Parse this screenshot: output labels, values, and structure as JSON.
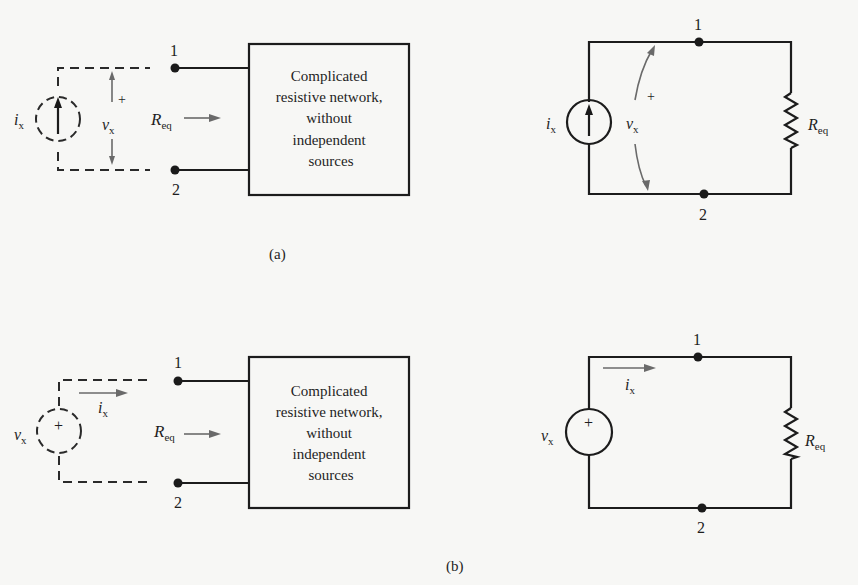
{
  "figure": {
    "panels": [
      {
        "id": "a",
        "caption": "(a)",
        "test_circuit": {
          "source_type": "current",
          "source_label": "i",
          "source_label_sub": "x",
          "measured_label": "v",
          "measured_label_sub": "x",
          "polarity_plus": "+",
          "node_top": "1",
          "node_bottom": "2",
          "req_label": "R",
          "req_label_sub": "eq",
          "box_lines": [
            "Complicated",
            "resistive network,",
            "without",
            "independent",
            "sources"
          ]
        },
        "equivalent_circuit": {
          "source_label": "i",
          "source_label_sub": "x",
          "voltage_label": "v",
          "voltage_label_sub": "x",
          "polarity_plus": "+",
          "node_top": "1",
          "node_bottom": "2",
          "resistor_label": "R",
          "resistor_label_sub": "eq"
        }
      },
      {
        "id": "b",
        "caption": "(b)",
        "test_circuit": {
          "source_type": "voltage",
          "source_label": "v",
          "source_label_sub": "x",
          "source_plus": "+",
          "current_label": "i",
          "current_label_sub": "x",
          "node_top": "1",
          "node_bottom": "2",
          "req_label": "R",
          "req_label_sub": "eq",
          "box_lines": [
            "Complicated",
            "resistive network,",
            "without",
            "independent",
            "sources"
          ]
        },
        "equivalent_circuit": {
          "source_label": "v",
          "source_label_sub": "x",
          "source_plus": "+",
          "current_label": "i",
          "current_label_sub": "x",
          "node_top": "1",
          "node_bottom": "2",
          "resistor_label": "R",
          "resistor_label_sub": "eq"
        }
      }
    ],
    "colors": {
      "background": "#f7f7f5",
      "line": "#1c1c1c",
      "arrow": "#6a6a6a"
    }
  }
}
